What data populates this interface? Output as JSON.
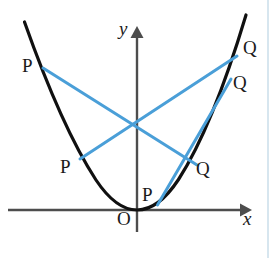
{
  "figure": {
    "background_color": "#ffffff",
    "width": 280,
    "height": 258,
    "curve_color": "#101010",
    "chord_color": "#4a9fd8",
    "axis_color": "#4d4d4d",
    "page_rule_color": "#d7e6ef"
  },
  "axes": {
    "x_label": "x",
    "y_label": "y",
    "origin_label": "O",
    "x_axis_y": 210,
    "y_axis_x": 137,
    "x_axis_from": 8,
    "x_axis_to": 245,
    "y_axis_from": 232,
    "y_axis_to": 30
  },
  "curve": {
    "name": "parabola",
    "equation": "y = a*x^2",
    "vertex": [
      137,
      210
    ],
    "a_pixels": 0.01675,
    "x_from": 24,
    "x_to": 246
  },
  "labels": {
    "p_points": [
      {
        "text": "P",
        "x": 22,
        "y": 56
      },
      {
        "text": "P",
        "x": 60,
        "y": 157
      },
      {
        "text": "P",
        "x": 142,
        "y": 185
      }
    ],
    "q_points": [
      {
        "text": "Q",
        "x": 243,
        "y": 38
      },
      {
        "text": "Q",
        "x": 233,
        "y": 73
      },
      {
        "text": "Q",
        "x": 196,
        "y": 159
      }
    ],
    "origin": {
      "text": "O",
      "x": 117,
      "y": 209
    },
    "x_axis": {
      "text": "x",
      "x": 243,
      "y": 209
    },
    "y_axis": {
      "text": "y",
      "x": 119,
      "y": 19
    }
  },
  "chords": [
    {
      "name": "chord-p1-q3",
      "from_label": "P",
      "to_label": "Q",
      "from": [
        43,
        68
      ],
      "to": [
        196,
        164
      ]
    },
    {
      "name": "chord-p2-q1",
      "from_label": "P",
      "to_label": "Q",
      "from": [
        80,
        159
      ],
      "to": [
        236,
        57
      ]
    },
    {
      "name": "chord-p3-q2",
      "from_label": "P",
      "to_label": "Q",
      "from": [
        157,
        205
      ],
      "to": [
        230,
        80
      ]
    }
  ],
  "page_rule": {
    "x": 268,
    "y_from": 0,
    "y_to": 258
  }
}
